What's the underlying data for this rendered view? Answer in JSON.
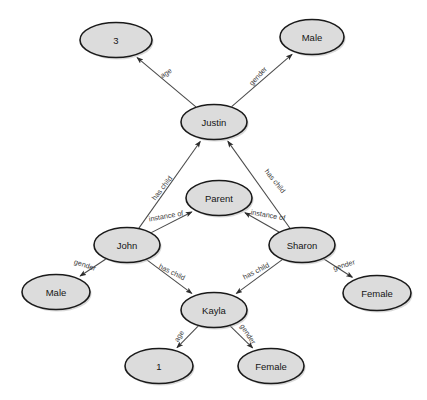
{
  "diagram": {
    "type": "directed-graph",
    "corner_mark": "",
    "colors": {
      "node_fill": "#dcdcdc",
      "node_stroke": "#1a1a1a",
      "edge_stroke": "#4a4a4a",
      "label_text": "#151515",
      "edge_label_text": "#3b3b3b",
      "background": "#ffffff"
    },
    "nodes": [
      {
        "id": "age3",
        "label": "3",
        "cx": 116,
        "cy": 40,
        "rx": 36,
        "ry": 17.5
      },
      {
        "id": "male_top",
        "label": "Male",
        "cx": 312,
        "cy": 37,
        "rx": 32,
        "ry": 17.5
      },
      {
        "id": "justin",
        "label": "Justin",
        "cx": 214,
        "cy": 122,
        "rx": 33,
        "ry": 17.5
      },
      {
        "id": "parent",
        "label": "Parent",
        "cx": 219,
        "cy": 198,
        "rx": 33,
        "ry": 17.5
      },
      {
        "id": "john",
        "label": "John",
        "cx": 127,
        "cy": 245,
        "rx": 33,
        "ry": 17.5
      },
      {
        "id": "sharon",
        "label": "Sharon",
        "cx": 302,
        "cy": 245,
        "rx": 33,
        "ry": 17.5
      },
      {
        "id": "male_left",
        "label": "Male",
        "cx": 56,
        "cy": 292,
        "rx": 34,
        "ry": 17.5
      },
      {
        "id": "female_rt",
        "label": "Female",
        "cx": 377,
        "cy": 293,
        "rx": 34,
        "ry": 17.5
      },
      {
        "id": "kayla",
        "label": "Kayla",
        "cx": 214,
        "cy": 310,
        "rx": 33,
        "ry": 17.5
      },
      {
        "id": "age1",
        "label": "1",
        "cx": 159,
        "cy": 366,
        "rx": 34,
        "ry": 17.5
      },
      {
        "id": "female_bt",
        "label": "Female",
        "cx": 271,
        "cy": 366,
        "rx": 33,
        "ry": 17.5
      }
    ],
    "edges": [
      {
        "id": "e1",
        "from": "justin",
        "to": "age3",
        "label": "age",
        "lx": 166,
        "ly": 73,
        "rotate": -33
      },
      {
        "id": "e2",
        "from": "justin",
        "to": "male_top",
        "label": "gender",
        "lx": 258,
        "ly": 76,
        "rotate": -48
      },
      {
        "id": "e3",
        "from": "john",
        "to": "justin",
        "label": "has child",
        "lx": 162,
        "ly": 188,
        "rotate": -52
      },
      {
        "id": "e4",
        "from": "sharon",
        "to": "justin",
        "label": "has child",
        "lx": 275,
        "ly": 181,
        "rotate": 51
      },
      {
        "id": "e5",
        "from": "john",
        "to": "parent",
        "label": "instance of",
        "lx": 166,
        "ly": 216,
        "rotate": -10
      },
      {
        "id": "e6",
        "from": "sharon",
        "to": "parent",
        "label": "instance of",
        "lx": 268,
        "ly": 215,
        "rotate": 10
      },
      {
        "id": "e7",
        "from": "john",
        "to": "male_left",
        "label": "gender",
        "lx": 85,
        "ly": 265,
        "rotate": 19
      },
      {
        "id": "e8",
        "from": "john",
        "to": "kayla",
        "label": "has child",
        "lx": 172,
        "ly": 272,
        "rotate": 26
      },
      {
        "id": "e9",
        "from": "sharon",
        "to": "kayla",
        "label": "has child",
        "lx": 256,
        "ly": 271,
        "rotate": -27
      },
      {
        "id": "e10",
        "from": "sharon",
        "to": "female_rt",
        "label": "gender",
        "lx": 344,
        "ly": 265,
        "rotate": -18
      },
      {
        "id": "e11",
        "from": "kayla",
        "to": "age1",
        "label": "age",
        "lx": 179,
        "ly": 336,
        "rotate": -58
      },
      {
        "id": "e12",
        "from": "kayla",
        "to": "female_bt",
        "label": "gender",
        "lx": 248,
        "ly": 334,
        "rotate": 56
      }
    ]
  }
}
